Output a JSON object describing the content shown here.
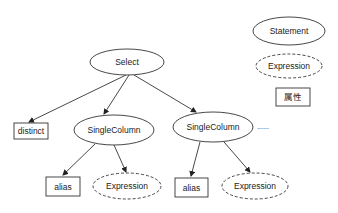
{
  "diagram": {
    "nodes": {
      "select": {
        "label": "Select",
        "shape": "ellipse",
        "style": "solid"
      },
      "distinct": {
        "label": "distinct",
        "shape": "rect"
      },
      "single_column_1": {
        "label": "SingleColumn",
        "shape": "ellipse",
        "style": "solid"
      },
      "single_column_2": {
        "label": "SingleColumn",
        "shape": "ellipse",
        "style": "solid"
      },
      "ellipsis": {
        "label": "......"
      },
      "alias_1": {
        "label": "alias",
        "shape": "rect"
      },
      "expression_1": {
        "label": "Expression",
        "shape": "ellipse",
        "style": "dashed"
      },
      "alias_2": {
        "label": "alias",
        "shape": "rect"
      },
      "expression_2": {
        "label": "Expression",
        "shape": "ellipse",
        "style": "dashed"
      }
    },
    "edges": [
      {
        "from": "Select",
        "to": "distinct"
      },
      {
        "from": "Select",
        "to": "SingleColumn (1)"
      },
      {
        "from": "Select",
        "to": "SingleColumn (2)"
      },
      {
        "from": "SingleColumn (1)",
        "to": "alias (1)"
      },
      {
        "from": "SingleColumn (1)",
        "to": "Expression (1)"
      },
      {
        "from": "SingleColumn (2)",
        "to": "alias (2)"
      },
      {
        "from": "SingleColumn (2)",
        "to": "Expression (2)"
      }
    ]
  },
  "legend": {
    "statement": {
      "label": "Statement",
      "shape": "ellipse",
      "style": "solid"
    },
    "expression": {
      "label": "Expression",
      "shape": "ellipse",
      "style": "dashed"
    },
    "attribute": {
      "label": "属性",
      "shape": "rect"
    }
  },
  "colors": {
    "stroke": "#333333",
    "text": "#222222",
    "background": "#ffffff"
  }
}
